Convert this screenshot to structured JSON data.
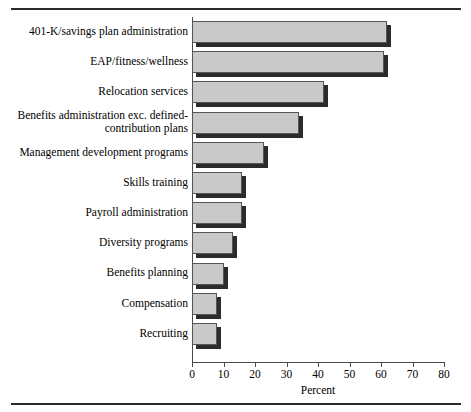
{
  "chart_data": {
    "type": "bar",
    "orientation": "horizontal",
    "title": "",
    "xlabel": "Percent",
    "ylabel": "",
    "xlim": [
      0,
      80
    ],
    "xticks": [
      0,
      10,
      20,
      30,
      40,
      50,
      60,
      70,
      80
    ],
    "grid": false,
    "legend": null,
    "categories": [
      "401-K/savings plan administration",
      "EAP/fitness/wellness",
      "Relocation services",
      "Benefits administration exc. defined-\ncontribution plans",
      "Management development programs",
      "Skills training",
      "Payroll administration",
      "Diversity programs",
      "Benefits planning",
      "Compensation",
      "Recruiting"
    ],
    "values": [
      62,
      61,
      42,
      34,
      23,
      16,
      16,
      13,
      10,
      8,
      8
    ],
    "bar_fill_color": "#c9c9c9",
    "bar_edge_color": "#555555",
    "bar_shadow_color": "#2b2b2b"
  },
  "axis": {
    "tick_labels": [
      "0",
      "10",
      "20",
      "30",
      "40",
      "50",
      "60",
      "70",
      "80"
    ],
    "title": "Percent"
  }
}
